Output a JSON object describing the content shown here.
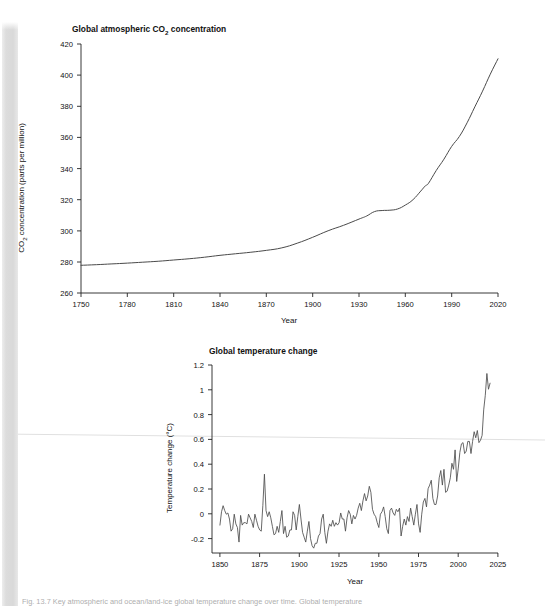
{
  "page": {
    "background_color": "#ffffff",
    "scan_band_color": "#dcdcdc",
    "seam_line_color": "#dfdfdf",
    "caption_partial": "Fig. 13.7 Key atmospheric and ocean/land-ice global temperature change over time. Global temperature"
  },
  "charts": [
    {
      "id": "co2",
      "chart_data": {
        "type": "line",
        "title_prefix": "Global atmospheric CO",
        "title_sub": "2",
        "title_suffix": " concentration",
        "title": "Global atmospheric CO2 concentration",
        "xlabel": "Year",
        "ylabel_prefix": "CO",
        "ylabel_sub": "2",
        "ylabel_suffix": " concentration (parts per million)",
        "ylabel": "CO2 concentration (parts per million)",
        "xlim": [
          1750,
          2020
        ],
        "ylim": [
          260,
          420
        ],
        "grid": false,
        "legend": "none",
        "line_color": "#4a4a4a",
        "xticks": [
          1750,
          1780,
          1810,
          1840,
          1870,
          1900,
          1930,
          1960,
          1990,
          2020
        ],
        "yticks": [
          260,
          280,
          300,
          320,
          340,
          360,
          380,
          400,
          420
        ],
        "x": [
          1750,
          1760,
          1770,
          1780,
          1790,
          1800,
          1810,
          1820,
          1830,
          1840,
          1850,
          1860,
          1870,
          1880,
          1890,
          1900,
          1910,
          1920,
          1930,
          1935,
          1940,
          1945,
          1950,
          1955,
          1960,
          1965,
          1970,
          1973,
          1975,
          1980,
          1985,
          1990,
          1995,
          2000,
          2005,
          2010,
          2015,
          2020
        ],
        "values": [
          277.8,
          278.2,
          278.7,
          279.2,
          279.8,
          280.4,
          281.2,
          282.0,
          283.0,
          284.2,
          285.2,
          286.2,
          287.4,
          289.0,
          292.0,
          295.8,
          300.0,
          303.5,
          307.5,
          309.5,
          312.3,
          313.0,
          313.2,
          314.0,
          316.5,
          320.0,
          325.5,
          328.9,
          330.5,
          338.7,
          346.0,
          354.2,
          360.6,
          369.4,
          379.6,
          389.7,
          400.6,
          410.5
        ]
      }
    },
    {
      "id": "temperature",
      "chart_data": {
        "type": "line",
        "title": "Global temperature change",
        "xlabel": "Year",
        "ylabel": "Temperature change (°C)",
        "xlim": [
          1845,
          2025
        ],
        "ylim": [
          -0.3,
          1.25
        ],
        "grid": false,
        "legend": "none",
        "line_color": "#4d4d4d",
        "xticks": [
          1850,
          1875,
          1900,
          1925,
          1950,
          1975,
          2000,
          2025
        ],
        "yticks": [
          -0.2,
          0.0,
          0.2,
          0.4,
          0.6,
          0.8,
          1.0,
          1.2
        ],
        "x": [
          1850,
          1851,
          1852,
          1853,
          1854,
          1855,
          1856,
          1857,
          1858,
          1859,
          1860,
          1861,
          1862,
          1863,
          1864,
          1865,
          1866,
          1867,
          1868,
          1869,
          1870,
          1871,
          1872,
          1873,
          1874,
          1875,
          1876,
          1877,
          1878,
          1879,
          1880,
          1881,
          1882,
          1883,
          1884,
          1885,
          1886,
          1887,
          1888,
          1889,
          1890,
          1891,
          1892,
          1893,
          1894,
          1895,
          1896,
          1897,
          1898,
          1899,
          1900,
          1901,
          1902,
          1903,
          1904,
          1905,
          1906,
          1907,
          1908,
          1909,
          1910,
          1911,
          1912,
          1913,
          1914,
          1915,
          1916,
          1917,
          1918,
          1919,
          1920,
          1921,
          1922,
          1923,
          1924,
          1925,
          1926,
          1927,
          1928,
          1929,
          1930,
          1931,
          1932,
          1933,
          1934,
          1935,
          1936,
          1937,
          1938,
          1939,
          1940,
          1941,
          1942,
          1943,
          1944,
          1945,
          1946,
          1947,
          1948,
          1949,
          1950,
          1951,
          1952,
          1953,
          1954,
          1955,
          1956,
          1957,
          1958,
          1959,
          1960,
          1961,
          1962,
          1963,
          1964,
          1965,
          1966,
          1967,
          1968,
          1969,
          1970,
          1971,
          1972,
          1973,
          1974,
          1975,
          1976,
          1977,
          1978,
          1979,
          1980,
          1981,
          1982,
          1983,
          1984,
          1985,
          1986,
          1987,
          1988,
          1989,
          1990,
          1991,
          1992,
          1993,
          1994,
          1995,
          1996,
          1997,
          1998,
          1999,
          2000,
          2001,
          2002,
          2003,
          2004,
          2005,
          2006,
          2007,
          2008,
          2009,
          2010,
          2011,
          2012,
          2013,
          2014,
          2015,
          2016,
          2017,
          2018,
          2019,
          2020
        ],
        "values": [
          -0.07,
          0.04,
          0.09,
          0.05,
          0.02,
          0.03,
          -0.02,
          -0.12,
          -0.1,
          0.02,
          -0.06,
          -0.09,
          -0.21,
          0.01,
          -0.07,
          -0.05,
          -0.05,
          -0.06,
          0.02,
          -0.01,
          -0.04,
          -0.09,
          0.02,
          -0.03,
          -0.08,
          -0.11,
          -0.12,
          0.09,
          0.35,
          0.05,
          0.0,
          0.04,
          -0.01,
          -0.08,
          -0.15,
          -0.14,
          -0.08,
          -0.13,
          -0.04,
          0.05,
          -0.14,
          -0.08,
          -0.17,
          -0.16,
          -0.11,
          -0.11,
          0.04,
          0.01,
          -0.11,
          0.0,
          0.1,
          -0.02,
          -0.13,
          -0.17,
          -0.21,
          -0.12,
          -0.04,
          -0.18,
          -0.24,
          -0.26,
          -0.22,
          -0.22,
          -0.16,
          -0.14,
          -0.02,
          0.02,
          -0.13,
          -0.22,
          -0.12,
          -0.06,
          -0.08,
          -0.03,
          -0.08,
          -0.05,
          -0.07,
          -0.05,
          0.03,
          -0.02,
          -0.02,
          -0.12,
          -0.01,
          0.05,
          0.02,
          -0.06,
          0.01,
          -0.02,
          0.01,
          0.07,
          0.11,
          0.05,
          0.13,
          0.19,
          0.13,
          0.17,
          0.25,
          0.2,
          0.06,
          0.02,
          0.0,
          -0.05,
          -0.09,
          0.02,
          0.04,
          0.08,
          0.0,
          -0.1,
          -0.14,
          0.05,
          0.07,
          0.03,
          0.01,
          0.06,
          0.04,
          0.07,
          -0.16,
          -0.08,
          -0.02,
          -0.07,
          0.0,
          -0.04,
          0.07,
          0.0,
          -0.07,
          0.02,
          0.1,
          -0.06,
          -0.13,
          0.02,
          0.12,
          0.15,
          0.08,
          0.23,
          0.26,
          0.3,
          0.15,
          0.1,
          0.1,
          0.17,
          0.32,
          0.38,
          0.26,
          0.39,
          0.2,
          0.21,
          0.26,
          0.32,
          0.44,
          0.39,
          0.55,
          0.29,
          0.4,
          0.53,
          0.6,
          0.61,
          0.52,
          0.54,
          0.62,
          0.62,
          0.52,
          0.62,
          0.7,
          0.65,
          0.71,
          0.61,
          0.63,
          0.67,
          0.88,
          1.0,
          1.18,
          1.05,
          1.1,
          1.06,
          1.13
        ]
      }
    }
  ]
}
